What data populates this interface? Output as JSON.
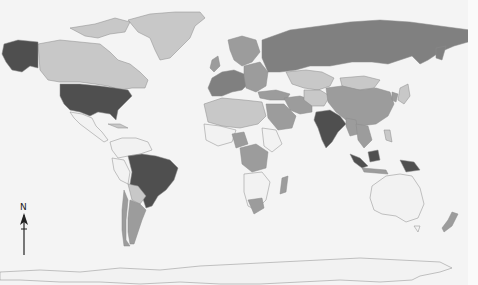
{
  "map": {
    "type": "choropleth",
    "projection": "world",
    "colormode": "grayscale",
    "palette": {
      "no_data": "#f2f2f2",
      "low": "#c8c8c8",
      "medium": "#9c9c9c",
      "high": "#808080",
      "highest": "#4f4f4f",
      "background": "#f4f4f4",
      "border": "#8a8a8a"
    },
    "highlighted_highest": [
      "United States",
      "Alaska",
      "Brazil",
      "India",
      "Indonesia (part)",
      "Papua New Guinea"
    ],
    "high_class": [
      "Russia",
      "Western Europe",
      "Argentina",
      "Kazakhstan region",
      "Central Africa (several)",
      "New Zealand"
    ],
    "medium_class": [
      "China",
      "Iran",
      "Saudi Arabia",
      "Chile",
      "Southern Africa"
    ],
    "low_class": [
      "Canada",
      "Greenland",
      "North Africa",
      "Mongolia",
      "Central Asia",
      "Japan"
    ],
    "no_data": [
      "Australia",
      "Antarctica",
      "Mexico",
      "Colombia",
      "parts of Africa"
    ]
  },
  "north_arrow": {
    "label": "N"
  }
}
